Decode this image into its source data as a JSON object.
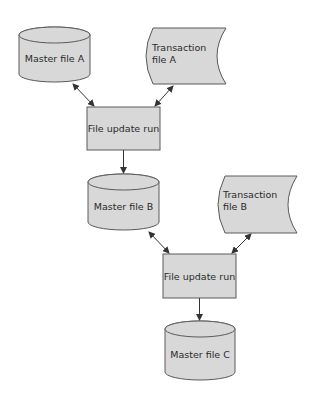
{
  "diagram": {
    "type": "flowchart",
    "colors": {
      "fill": "#d8d8d8",
      "stroke": "#5a5a5a",
      "text": "#2a2a2a",
      "background": "#ffffff"
    },
    "nodes": [
      {
        "id": "master_a",
        "shape": "disk",
        "label": "Master file A"
      },
      {
        "id": "trans_a",
        "shape": "stored-data",
        "label_line1": "Transaction",
        "label_line2": "file A"
      },
      {
        "id": "run_1",
        "shape": "process",
        "label": "File update run"
      },
      {
        "id": "master_b",
        "shape": "disk",
        "label": "Master file B"
      },
      {
        "id": "trans_b",
        "shape": "stored-data",
        "label_line1": "Transaction",
        "label_line2": "file B"
      },
      {
        "id": "run_2",
        "shape": "process",
        "label": "File update run"
      },
      {
        "id": "master_c",
        "shape": "disk",
        "label": "Master file C"
      }
    ],
    "edges": [
      {
        "from": "master_a",
        "to": "run_1",
        "direction": "both"
      },
      {
        "from": "trans_a",
        "to": "run_1",
        "direction": "both"
      },
      {
        "from": "run_1",
        "to": "master_b",
        "direction": "forward"
      },
      {
        "from": "master_b",
        "to": "run_2",
        "direction": "both"
      },
      {
        "from": "trans_b",
        "to": "run_2",
        "direction": "both"
      },
      {
        "from": "run_2",
        "to": "master_c",
        "direction": "forward"
      }
    ]
  }
}
